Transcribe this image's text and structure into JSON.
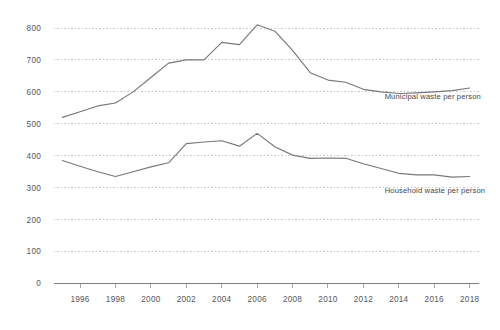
{
  "chart_data": {
    "type": "line",
    "title": "",
    "subtitle": "",
    "xlabel": "",
    "ylabel": "",
    "xlim": [
      1994.5,
      2018.5
    ],
    "ylim": [
      0,
      800
    ],
    "grid": true,
    "grid_axis": "y",
    "legend_position": "inline-right",
    "x": [
      1995,
      1996,
      1997,
      1998,
      1999,
      2000,
      2001,
      2002,
      2003,
      2004,
      2005,
      2006,
      2007,
      2008,
      2009,
      2010,
      2011,
      2012,
      2013,
      2014,
      2015,
      2016,
      2017,
      2018
    ],
    "x_tick_labels": [
      "1996",
      "1998",
      "2000",
      "2002",
      "2004",
      "2006",
      "2008",
      "2010",
      "2012",
      "2014",
      "2016",
      "2018"
    ],
    "x_ticks": [
      1996,
      1998,
      2000,
      2002,
      2004,
      2006,
      2008,
      2010,
      2012,
      2014,
      2016,
      2018
    ],
    "y_ticks": [
      0,
      100,
      200,
      300,
      400,
      500,
      600,
      700,
      800
    ],
    "y_tick_labels": [
      "0",
      "100",
      "200",
      "300",
      "400",
      "500",
      "600",
      "700",
      "800"
    ],
    "series": [
      {
        "name": "Municipal waste per person",
        "label": "Municipal waste per person",
        "color": "#77787c",
        "label_x": 2013.2,
        "label_y": 578,
        "values": [
          520,
          538,
          556,
          565,
          600,
          645,
          690,
          700,
          700,
          755,
          748,
          810,
          790,
          730,
          660,
          637,
          630,
          608,
          600,
          595,
          597,
          600,
          604,
          612
        ]
      },
      {
        "name": "Household waste per person",
        "label": "Household waste per person",
        "color": "#77787c",
        "label_x": 2013.2,
        "label_y": 282,
        "values": [
          385,
          367,
          350,
          335,
          350,
          365,
          378,
          438,
          443,
          447,
          430,
          470,
          428,
          402,
          392,
          393,
          392,
          375,
          360,
          345,
          340,
          340,
          333,
          335
        ]
      }
    ],
    "colors": {
      "line": "#77787c",
      "gridline": "#b9b9bd",
      "axis": "#7e7f83",
      "tick_text": "#55565a",
      "label_text": "#44464a",
      "background": "#ffffff"
    }
  }
}
